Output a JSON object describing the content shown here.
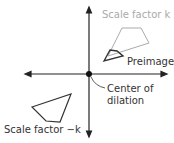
{
  "labels": {
    "scale_k": "Scale factor k",
    "preimage": "Preimage",
    "center_line1": "Center of",
    "center_line2": "dilation",
    "scale_neg_k": "Scale factor −k"
  },
  "colors": {
    "axis": "#222222",
    "gray": "#aaaaaa",
    "dark": "#333333"
  }
}
